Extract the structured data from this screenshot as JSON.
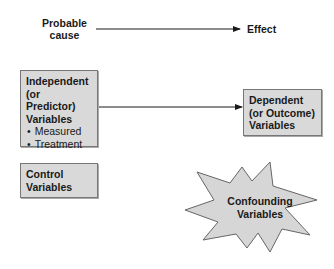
{
  "top_row": {
    "cause_label": [
      "Probable",
      "cause"
    ],
    "effect_label": "Effect"
  },
  "independent_box": {
    "title_lines": [
      "Independent",
      "(or Predictor)",
      "Variables"
    ],
    "bullets": [
      "Measured",
      "Treatment"
    ]
  },
  "dependent_box": {
    "title_lines": [
      "Dependent",
      "(or Outcome)",
      "Variables"
    ]
  },
  "control_box": {
    "title_lines": [
      "Control",
      "Variables"
    ]
  },
  "confounding_star": {
    "title_lines": [
      "Confounding",
      "Variables"
    ]
  },
  "colors": {
    "box_fill": "#d9d9d9",
    "box_border": "#777777",
    "arrow": "#1a1a1a",
    "star_fill": "#d6d6d6"
  }
}
